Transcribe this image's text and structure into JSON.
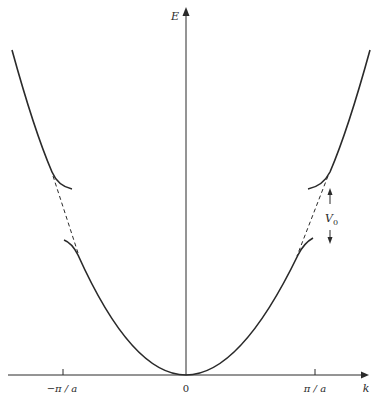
{
  "diagram": {
    "axes": {
      "y_label": "E",
      "x_label": "k",
      "x_ticks": [
        {
          "label": "−π / a",
          "position": "-pi/a"
        },
        {
          "label": "0",
          "position": "0"
        },
        {
          "label": "π / a",
          "position": "pi/a"
        }
      ]
    },
    "annotations": {
      "gap_label": "V",
      "gap_label_subscript": "0"
    },
    "curves": [
      {
        "name": "free-electron parabola (dashed across gap)",
        "style": "dashed"
      },
      {
        "name": "band 1 (lower)",
        "style": "solid"
      },
      {
        "name": "band 2 (upper)",
        "style": "solid"
      }
    ],
    "colors": {
      "ink": "#2a2a2a",
      "background": "#ffffff"
    }
  }
}
